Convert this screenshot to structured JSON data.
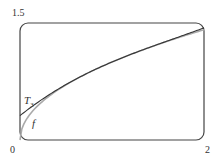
{
  "chart_data": {
    "type": "line",
    "title": "",
    "xlabel": "",
    "ylabel": "",
    "xlim": [
      0,
      2
    ],
    "ylim": [
      0,
      1.5
    ],
    "x_ticks": [
      "0",
      "2"
    ],
    "y_ticks": [
      "1.5"
    ],
    "grid": false,
    "series": [
      {
        "name": "f",
        "description": "f(x) = sqrt(x)",
        "color": "#aaaaaa",
        "x": [
          0,
          0.05,
          0.1,
          0.2,
          0.3,
          0.4,
          0.5,
          0.75,
          1.0,
          1.25,
          1.5,
          1.75,
          2.0
        ],
        "values": [
          0,
          0.224,
          0.316,
          0.447,
          0.548,
          0.632,
          0.707,
          0.866,
          1.0,
          1.118,
          1.225,
          1.323,
          1.414
        ]
      },
      {
        "name": "T3",
        "description": "Third-degree Taylor polynomial of sqrt(x) about x=1",
        "color": "#333333",
        "x": [
          0,
          0.25,
          0.5,
          0.75,
          1.0,
          1.25,
          1.5,
          1.75,
          2.0
        ],
        "values": [
          0.3125,
          0.5137,
          0.7109,
          0.8662,
          1.0,
          1.1182,
          1.2266,
          1.3232,
          1.4375
        ]
      }
    ],
    "annotations": [
      {
        "text": "T",
        "subscript": "3",
        "x": 0.1,
        "y": 0.35
      },
      {
        "text": "f",
        "x": 0.2,
        "y": 0.15
      }
    ]
  },
  "labels": {
    "y_top": "1.5",
    "origin": "0",
    "x_right": "2",
    "t3_main": "T",
    "t3_sub": "3",
    "f": "f"
  }
}
